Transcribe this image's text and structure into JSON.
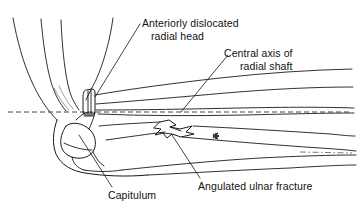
{
  "figure": {
    "type": "medical-line-drawing",
    "background_color": "#ffffff",
    "ink_color": "#1a1a1a",
    "reference_line_color": "#333333"
  },
  "labels": {
    "radial_head": {
      "line1": "Anteriorly dislocated",
      "line2": "radial head"
    },
    "central_axis": {
      "line1": "Central axis of",
      "line2": "radial shaft"
    },
    "capitulum": {
      "text": "Capitulum"
    },
    "ulnar_fracture": {
      "text": "Angulated ulnar fracture"
    }
  },
  "markers": {
    "asterisk": "*"
  },
  "annotations": {
    "dashed_reference_label": "central axis of radial shaft reference line",
    "leader_count": 4
  }
}
